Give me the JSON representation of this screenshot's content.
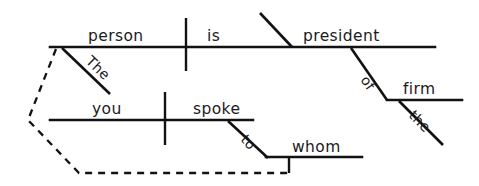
{
  "diagram": {
    "sentence": "The person you spoke to whom is president of the firm",
    "type": "sentence-diagram",
    "labels": {
      "subject": "person",
      "subject_article": "The",
      "verb": "is",
      "predicate_nominative": "president",
      "preposition_of": "of",
      "object_of_preposition": "firm",
      "firm_article": "the",
      "relative_subject": "you",
      "relative_verb": "spoke",
      "preposition_to": "to",
      "relative_pronoun": "whom"
    },
    "colors": {
      "ink": "#121212",
      "text": "#1b1b1b",
      "background": "#ffffff"
    },
    "lines": {
      "main_clause_baseline": "solid",
      "relative_clause_baseline": "solid",
      "relative_link": "dashed"
    }
  }
}
